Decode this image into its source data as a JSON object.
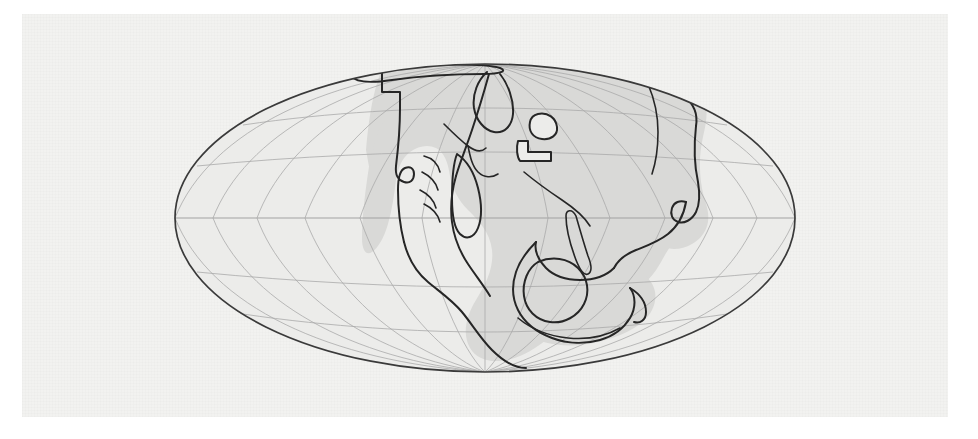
{
  "figure": {
    "kind": "paleogeographic-world-map",
    "title": "",
    "caption": "",
    "style": "hand-drawn line map, shaded landmass"
  },
  "canvas": {
    "width": 978,
    "height": 439,
    "page_background": "#ffffff",
    "plate_background": "#f2f2f0",
    "plate": {
      "left": 22,
      "top": 14,
      "width": 926,
      "height": 403
    }
  },
  "projection": {
    "name": "Mollweide",
    "central_meridian_degrees": 0,
    "outline_shape": "ellipse",
    "center_x": 485,
    "center_y": 218,
    "semi_axis_x": 310,
    "semi_axis_y": 154
  },
  "graticule": {
    "visible": true,
    "meridian_interval_degrees": 30,
    "parallel_interval_degrees": 30,
    "meridian_labels": [
      "-180",
      "-150",
      "-120",
      "-90",
      "-60",
      "-30",
      "0",
      "30",
      "60",
      "90",
      "120",
      "150",
      "180"
    ],
    "parallel_labels": [
      "-60",
      "-30",
      "0",
      "30",
      "60"
    ],
    "equator_emphasised": true,
    "line_color": "#a9a9a9",
    "equator_color": "#9b9b9b"
  },
  "colors": {
    "ocean": "#ececea",
    "land": "#d9d9d7",
    "coastline": "#262626",
    "outline": "#3a3a3a"
  },
  "legend": {
    "visible": false,
    "entries": []
  },
  "chart_data": {
    "type": "map",
    "title": "",
    "xlabel": "",
    "ylabel": "",
    "projection": "Mollweide",
    "xlim": [
      -180,
      180
    ],
    "ylim": [
      -90,
      90
    ],
    "grid": true,
    "legend_position": "none",
    "features": [
      {
        "name": "supercontinent-main",
        "role": "land",
        "description": "large central conjoined landmass spanning from north pole area down across the equator"
      },
      {
        "name": "northwest-craton",
        "role": "land",
        "description": "north-western block with stepped western margin (North America / Laurentia analogue)"
      },
      {
        "name": "eastern-landmass",
        "role": "land",
        "description": "eastern lobe with indented south-eastern coastline (Eurasia / Asia analogue)"
      },
      {
        "name": "southern-landmass",
        "role": "land",
        "description": "southern trailing block (Antarctica / Australia analogue)"
      },
      {
        "name": "inland-island-round",
        "role": "island",
        "description": "small rounded inland island near centre of plate"
      },
      {
        "name": "inland-island-boot",
        "role": "island",
        "description": "small angular inland island below the rounded island"
      },
      {
        "name": "interior-rift-lines",
        "role": "line",
        "description": "interior fracture / suture lines drawn across the supercontinent"
      }
    ],
    "annotations": []
  }
}
